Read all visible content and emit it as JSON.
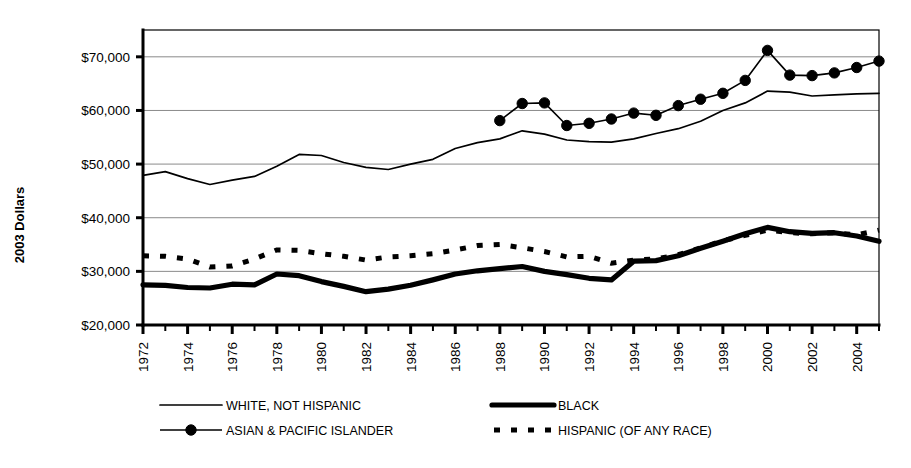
{
  "chart_data": {
    "type": "line",
    "title": "",
    "xlabel": "",
    "ylabel": "2003 Dollars",
    "ylim": [
      20000,
      75000
    ],
    "xlim": [
      1972,
      2005
    ],
    "grid": true,
    "legend_position": "bottom",
    "y_tick_labels": [
      "$70,000",
      "$60,000",
      "$50,000",
      "$40,000",
      "$30,000",
      "$20,000"
    ],
    "y_tick_values": [
      70000,
      60000,
      50000,
      40000,
      30000,
      20000
    ],
    "x_tick_labels": [
      "1972",
      "1974",
      "1976",
      "1978",
      "1980",
      "1982",
      "1984",
      "1986",
      "1988",
      "1990",
      "1992",
      "1994",
      "1996",
      "1998",
      "2000",
      "2002",
      "2004"
    ],
    "x_tick_values": [
      1972,
      1974,
      1976,
      1978,
      1980,
      1982,
      1984,
      1986,
      1988,
      1990,
      1992,
      1994,
      1996,
      1998,
      2000,
      2002,
      2004
    ],
    "x": [
      1972,
      1973,
      1974,
      1975,
      1976,
      1977,
      1978,
      1979,
      1980,
      1981,
      1982,
      1983,
      1984,
      1985,
      1986,
      1987,
      1988,
      1989,
      1990,
      1991,
      1992,
      1993,
      1994,
      1995,
      1996,
      1997,
      1998,
      1999,
      2000,
      2001,
      2002,
      2003,
      2004,
      2005
    ],
    "series": [
      {
        "name": "WHITE, NOT HISPANIC",
        "style": "thin-solid",
        "values": [
          47900,
          48600,
          47300,
          46200,
          47000,
          47700,
          49600,
          51800,
          51600,
          50300,
          49400,
          49000,
          50000,
          50900,
          52900,
          54000,
          54700,
          56200,
          55600,
          54500,
          54200,
          54100,
          54700,
          55700,
          56600,
          58000,
          60000,
          61400,
          63600,
          63400,
          62700,
          62900,
          63100,
          63200
        ]
      },
      {
        "name": "BLACK",
        "style": "thick-solid",
        "values": [
          27500,
          27400,
          27000,
          26900,
          27600,
          27500,
          29500,
          29200,
          28100,
          27200,
          26200,
          26700,
          27400,
          28400,
          29500,
          30100,
          30500,
          30900,
          30000,
          29400,
          28700,
          28400,
          31900,
          32000,
          32900,
          34300,
          35600,
          37000,
          38200,
          37400,
          37100,
          37200,
          36600,
          35600
        ]
      },
      {
        "name": "ASIAN & PACIFIC ISLANDER",
        "style": "marker-line",
        "values": [
          null,
          null,
          null,
          null,
          null,
          null,
          null,
          null,
          null,
          null,
          null,
          null,
          null,
          null,
          null,
          null,
          58100,
          61300,
          61400,
          57200,
          57600,
          58400,
          59500,
          59100,
          60900,
          62100,
          63200,
          65600,
          71200,
          66600,
          66500,
          67000,
          68000,
          69200
        ]
      },
      {
        "name": "HISPANIC (OF ANY RACE)",
        "style": "thick-dashed",
        "values": [
          32900,
          32800,
          32300,
          30800,
          31000,
          32300,
          34000,
          33900,
          33300,
          32800,
          32100,
          32700,
          32900,
          33300,
          34000,
          34800,
          35000,
          34400,
          33700,
          32700,
          32800,
          31500,
          32100,
          32300,
          33100,
          34400,
          35700,
          36700,
          37700,
          37200,
          37000,
          37200,
          36800,
          37700
        ]
      }
    ],
    "legend_entries": [
      {
        "label": "WHITE, NOT HISPANIC",
        "style": "thin-solid"
      },
      {
        "label": "BLACK",
        "style": "thick-solid"
      },
      {
        "label": "ASIAN & PACIFIC ISLANDER",
        "style": "marker-line"
      },
      {
        "label": "HISPANIC (OF ANY RACE)",
        "style": "thick-dashed"
      }
    ],
    "colors": {
      "series": "#000000",
      "gridline": "#8a8a8a",
      "background": "#ffffff",
      "axis": "#000000"
    }
  }
}
